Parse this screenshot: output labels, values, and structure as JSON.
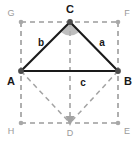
{
  "figure": {
    "canvas": {
      "width": 135,
      "height": 142
    },
    "colors": {
      "triangle_stroke": "#1a1a1a",
      "construction_stroke": "#9c9c9c",
      "vertex_dot": "#4d4d4d",
      "aux_dot": "#a8a8a8",
      "angle_fill": "#b0b0b0",
      "main_label": "#181818",
      "aux_label": "#9a9a9a",
      "background": "#ffffff"
    }
  },
  "points": {
    "main": [
      {
        "id": "C",
        "label": "C",
        "x": 70,
        "y": 22,
        "label_x": 70,
        "label_y": 9
      },
      {
        "id": "A",
        "label": "A",
        "x": 21,
        "y": 71,
        "label_x": 11,
        "label_y": 81
      },
      {
        "id": "B",
        "label": "B",
        "x": 118,
        "y": 71,
        "label_x": 128,
        "label_y": 81
      }
    ],
    "aux": [
      {
        "id": "G",
        "label": "G",
        "x": 21,
        "y": 22,
        "label_x": 11,
        "label_y": 13
      },
      {
        "id": "F",
        "label": "F",
        "x": 118,
        "y": 22,
        "label_x": 127,
        "label_y": 13
      },
      {
        "id": "H",
        "label": "H",
        "x": 21,
        "y": 123,
        "label_x": 11,
        "label_y": 131
      },
      {
        "id": "E",
        "label": "E",
        "x": 118,
        "y": 123,
        "label_x": 127,
        "label_y": 131
      },
      {
        "id": "D",
        "label": "D",
        "x": 70,
        "y": 123,
        "label_x": 70,
        "label_y": 133
      }
    ]
  },
  "sides": [
    {
      "id": "b",
      "label": "b",
      "from": "A",
      "to": "C",
      "label_x": 41,
      "label_y": 43
    },
    {
      "id": "a",
      "label": "a",
      "from": "C",
      "to": "B",
      "label_x": 102,
      "label_y": 43
    },
    {
      "id": "c",
      "label": "c",
      "from": "A",
      "to": "B",
      "label_x": 83,
      "label_y": 83
    }
  ],
  "solid_segments": [
    {
      "id": "seg-AC",
      "x1": 21,
      "y1": 71,
      "x2": 70,
      "y2": 22
    },
    {
      "id": "seg-CB",
      "x1": 70,
      "y1": 22,
      "x2": 118,
      "y2": 71
    },
    {
      "id": "seg-AB",
      "x1": 21,
      "y1": 71,
      "x2": 118,
      "y2": 71
    }
  ],
  "dashed_segments": [
    {
      "id": "seg-GF",
      "x1": 21,
      "y1": 22,
      "x2": 118,
      "y2": 22
    },
    {
      "id": "seg-GH",
      "x1": 21,
      "y1": 22,
      "x2": 21,
      "y2": 123
    },
    {
      "id": "seg-FE",
      "x1": 118,
      "y1": 22,
      "x2": 118,
      "y2": 123
    },
    {
      "id": "seg-HE",
      "x1": 21,
      "y1": 123,
      "x2": 118,
      "y2": 123
    },
    {
      "id": "seg-AD",
      "x1": 21,
      "y1": 71,
      "x2": 70,
      "y2": 123
    },
    {
      "id": "seg-BD",
      "x1": 118,
      "y1": 71,
      "x2": 70,
      "y2": 123
    }
  ],
  "dashed_arrow": {
    "id": "seg-CD-arrow",
    "x1": 70,
    "y1": 22,
    "x2": 70,
    "y2": 121,
    "head_points": "70,125 66,116 74,116"
  },
  "angle_marker": {
    "id": "angle-at-C",
    "vertex": "C",
    "path": "M 70 22 L 60 32 A 14 14 0 0 0 80 32 Z"
  }
}
